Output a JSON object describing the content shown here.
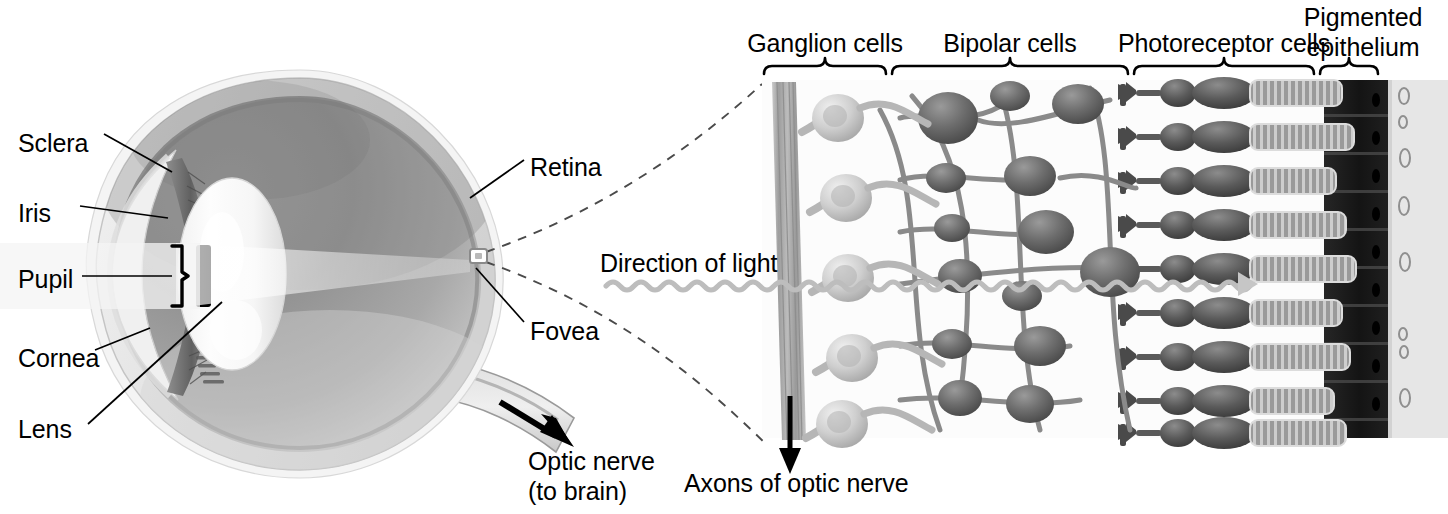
{
  "figure": {
    "background_color": "#ffffff",
    "text_color": "#000000"
  },
  "eye_diagram": {
    "name": "sagittal-section-of-eyeball",
    "labels": [
      {
        "key": "sclera",
        "text": "Sclera",
        "x": 18,
        "y": 128
      },
      {
        "key": "iris",
        "text": "Iris",
        "x": 18,
        "y": 198
      },
      {
        "key": "pupil",
        "text": "Pupil",
        "x": 18,
        "y": 264
      },
      {
        "key": "cornea",
        "text": "Cornea",
        "x": 18,
        "y": 343
      },
      {
        "key": "lens",
        "text": "Lens",
        "x": 18,
        "y": 414
      },
      {
        "key": "retina",
        "text": "Retina",
        "x": 530,
        "y": 152
      },
      {
        "key": "fovea",
        "text": "Fovea",
        "x": 530,
        "y": 316
      }
    ],
    "optic_nerve_label": {
      "line1": "Optic nerve",
      "line2": "(to brain)",
      "x": 528,
      "y": 446
    },
    "colors": {
      "sclera_outer": "#e8e8e8",
      "sclera_shade": "#cfcfcf",
      "vitreous_dark": "#8d8d8d",
      "vitreous_light": "#b9b9b9",
      "lens_white": "#fbfbfb",
      "iris_dark": "#6e6e6e",
      "pupil_black": "#000000",
      "leader_line": "#000000"
    }
  },
  "retina_panel": {
    "name": "retinal-cell-layers-magnification",
    "layer_labels": [
      {
        "key": "ganglion",
        "text": "Ganglion cells",
        "line1": "Ganglion cells",
        "line2": "",
        "brace_x1": 764,
        "brace_x2": 886,
        "label_cx": 825,
        "label_y": 28
      },
      {
        "key": "bipolar",
        "text": "Bipolar cells",
        "line1": "Bipolar cells",
        "line2": "",
        "brace_x1": 892,
        "brace_x2": 1128,
        "label_cx": 1010,
        "label_y": 28
      },
      {
        "key": "photoreceptor",
        "text": "Photoreceptor cells",
        "line1": "Photoreceptor cells",
        "line2": "",
        "brace_x1": 1134,
        "brace_x2": 1314,
        "label_cx": 1224,
        "label_y": 28
      },
      {
        "key": "pigmented",
        "text": "Pigmented epithelium",
        "line1": "Pigmented",
        "line2": "epithelium",
        "brace_x1": 1320,
        "brace_x2": 1378,
        "label_cx": 1382,
        "label_y": 2
      }
    ],
    "direction_of_light": {
      "text": "Direction of light",
      "x": 600,
      "y": 248
    },
    "axons_label": {
      "text": "Axons of optic nerve",
      "x": 684,
      "y": 468
    },
    "colors": {
      "ganglion_cell": "#c6c6c6",
      "bipolar_cell": "#6b6b6b",
      "photoreceptor": "#4a4a4a",
      "pigment_epithelium": "#1a1a1a",
      "choroid": "#e3e3e3",
      "axon_bundle": "#b0b0b0",
      "light_wave": "#b8b8b8",
      "brace": "#000000",
      "dashed_guide": "#4a4a4a"
    },
    "counts": {
      "ganglion_cells": 5,
      "bipolar_cells": 14,
      "photoreceptor_rows": 9,
      "pigment_cells": 10
    }
  }
}
